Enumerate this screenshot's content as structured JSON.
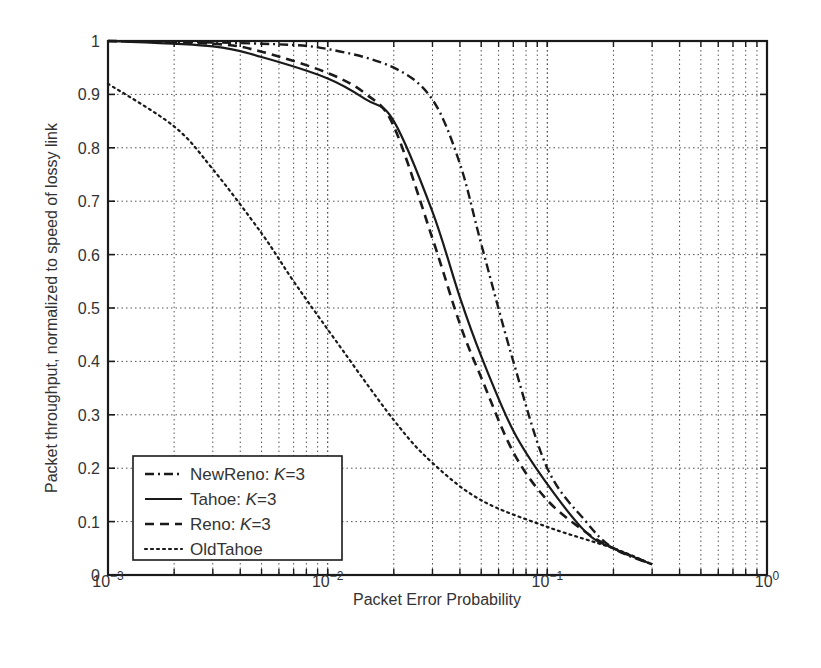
{
  "chart_data": {
    "type": "line",
    "title": "",
    "xlabel": "Packet Error Probability",
    "ylabel": "Packet throughput, normalized to speed of lossy link",
    "xscale": "log",
    "xlim": [
      0.001,
      1
    ],
    "ylim": [
      0,
      1
    ],
    "grid": true,
    "x_tick_labels": [
      {
        "base": "10",
        "exp": "−3",
        "value": 0.001
      },
      {
        "base": "10",
        "exp": "−2",
        "value": 0.01
      },
      {
        "base": "10",
        "exp": "−1",
        "value": 0.1
      },
      {
        "base": "10",
        "exp": "0",
        "value": 1
      }
    ],
    "y_tick_labels": [
      "0",
      "0.1",
      "0.2",
      "0.3",
      "0.4",
      "0.5",
      "0.6",
      "0.7",
      "0.8",
      "0.9",
      "1"
    ],
    "y_ticks": [
      0,
      0.1,
      0.2,
      0.3,
      0.4,
      0.5,
      0.6,
      0.7,
      0.8,
      0.9,
      1
    ],
    "legend_position": "lower left",
    "series": [
      {
        "name": "NewReno: K=3",
        "label_prefix": "NewReno: ",
        "label_var": "K",
        "label_suffix": "=3",
        "style": "dash-dot",
        "x": [
          0.001,
          0.005,
          0.01,
          0.02,
          0.03,
          0.04,
          0.05,
          0.07,
          0.1,
          0.15,
          0.2,
          0.3
        ],
        "values": [
          1.0,
          0.995,
          0.985,
          0.95,
          0.89,
          0.77,
          0.62,
          0.4,
          0.2,
          0.1,
          0.05,
          0.02
        ]
      },
      {
        "name": "Tahoe: K=3",
        "label_prefix": "Tahoe: ",
        "label_var": "K",
        "label_suffix": "=3",
        "style": "solid",
        "x": [
          0.001,
          0.003,
          0.005,
          0.01,
          0.015,
          0.02,
          0.03,
          0.04,
          0.05,
          0.07,
          0.1,
          0.15,
          0.2,
          0.3
        ],
        "values": [
          1.0,
          0.99,
          0.97,
          0.93,
          0.89,
          0.85,
          0.68,
          0.52,
          0.41,
          0.27,
          0.17,
          0.08,
          0.05,
          0.02
        ]
      },
      {
        "name": "Reno: K=3",
        "label_prefix": "Reno: ",
        "label_var": "K",
        "label_suffix": "=3",
        "style": "dashed",
        "x": [
          0.001,
          0.003,
          0.005,
          0.01,
          0.015,
          0.02,
          0.03,
          0.04,
          0.05,
          0.07,
          0.1,
          0.15,
          0.2,
          0.3
        ],
        "values": [
          1.0,
          0.995,
          0.98,
          0.94,
          0.9,
          0.84,
          0.63,
          0.47,
          0.37,
          0.23,
          0.14,
          0.08,
          0.05,
          0.02
        ]
      },
      {
        "name": "OldTahoe",
        "label_prefix": "OldTahoe",
        "label_var": "",
        "label_suffix": "",
        "style": "dotted",
        "x": [
          0.001,
          0.002,
          0.003,
          0.005,
          0.007,
          0.01,
          0.02,
          0.03,
          0.05,
          0.1,
          0.2,
          0.3
        ],
        "values": [
          0.92,
          0.84,
          0.76,
          0.64,
          0.55,
          0.46,
          0.29,
          0.21,
          0.14,
          0.09,
          0.05,
          0.02
        ]
      }
    ]
  },
  "colors": {
    "line": "#1a1a1a",
    "grid": "#555555",
    "text": "#333333",
    "background": "#ffffff"
  }
}
